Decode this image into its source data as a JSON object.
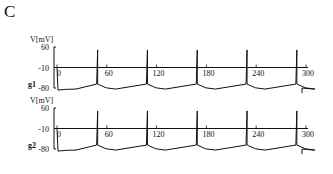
{
  "figure": {
    "panel_letter": "C"
  },
  "chart_data": [
    {
      "type": "line",
      "title": "",
      "ylabel": "V[mV]",
      "trace_label": "g1",
      "yticks": [
        "60",
        "-10",
        "-80"
      ],
      "xticks": [
        "0",
        "60",
        "120",
        "180",
        "240",
        "300"
      ],
      "xlim": [
        0,
        300
      ],
      "ylim": [
        -80,
        60
      ],
      "spike_times": [
        55,
        115,
        175,
        235,
        295
      ],
      "trace_baseline_mV": -70,
      "spike_peak_mV": 50,
      "grid": false
    },
    {
      "type": "line",
      "title": "",
      "ylabel": "V[mV]",
      "trace_label": "g2",
      "yticks": [
        "60",
        "-10",
        "-80"
      ],
      "xticks": [
        "0",
        "60",
        "120",
        "180",
        "240",
        "300"
      ],
      "xlim": [
        0,
        300
      ],
      "ylim": [
        -80,
        60
      ],
      "spike_times": [
        55,
        115,
        175,
        235,
        295
      ],
      "trace_baseline_mV": -70,
      "spike_peak_mV": 50,
      "grid": false
    }
  ]
}
